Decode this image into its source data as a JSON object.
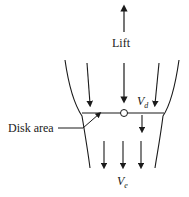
{
  "diagram": {
    "type": "actuator disk / rotor slipstream",
    "labels": {
      "lift": "Lift",
      "disk_area": "Disk area",
      "vd_main": "V",
      "vd_sub": "d",
      "ve_main": "V",
      "ve_sub": "e"
    },
    "colors": {
      "line": "#1a1a1a",
      "background": "#ffffff"
    }
  }
}
